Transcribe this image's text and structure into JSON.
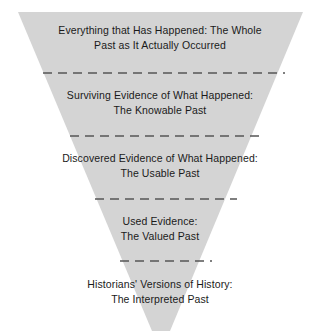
{
  "diagram": {
    "shape": "inverted-trapezoid-funnel",
    "fill_color": "#d4d4d4",
    "text_color": "#1a1a1a",
    "background_color": "#ffffff",
    "divider_color": "#555555",
    "divider_style": "dashed",
    "tiers": [
      {
        "id": "whole-past",
        "line1": "Everything that Has Happened: The Whole",
        "line2": "Past as It Actually Occurred",
        "text": "Everything that Has Happened: The Whole\nPast as It Actually Occurred"
      },
      {
        "id": "knowable-past",
        "line1": "Surviving Evidence of What Happened:",
        "line2": "The Knowable Past",
        "text": "Surviving Evidence of What Happened:\nThe Knowable Past"
      },
      {
        "id": "usable-past",
        "line1": "Discovered Evidence of What Happened:",
        "line2": "The Usable Past",
        "text": "Discovered Evidence of What Happened:\nThe Usable Past"
      },
      {
        "id": "valued-past",
        "line1": "Used Evidence:",
        "line2": "The Valued Past",
        "text": "Used Evidence:\nThe Valued Past"
      },
      {
        "id": "interpreted-past",
        "line1": "Historians' Versions of History:",
        "line2": "The Interpreted Past",
        "text": "Historians' Versions of History:\nThe Interpreted Past"
      }
    ]
  }
}
